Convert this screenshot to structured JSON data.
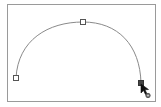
{
  "figure": {
    "colors": {
      "frame": "#9a9a9a",
      "path": "#8a8a8a",
      "anchor_stroke": "#555555",
      "anchor_fill": "#ffffff",
      "selected_anchor_fill": "#444444",
      "cursor": "#111111"
    },
    "anchors": [
      {
        "name": "left",
        "x": 16,
        "y": 78,
        "selected": false
      },
      {
        "name": "top",
        "x": 83,
        "y": 22,
        "selected": false
      },
      {
        "name": "right",
        "x": 141,
        "y": 83,
        "selected": true
      }
    ],
    "cursor": {
      "tool": "pen-tool",
      "modifier": "circle",
      "x": 142,
      "y": 84
    }
  }
}
